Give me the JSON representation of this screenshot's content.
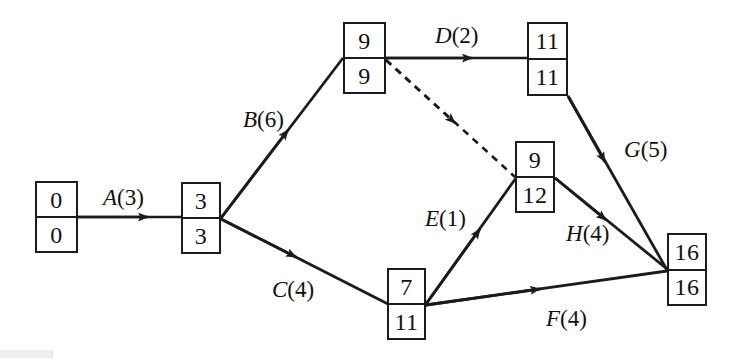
{
  "diagram": {
    "type": "pert-cpm-network",
    "canvas": {
      "width": 738,
      "height": 363
    },
    "line_color": "#1b1b1b",
    "text_color": "#111111",
    "background": "#ffffff",
    "nodes": [
      {
        "id": "n1",
        "early": "0",
        "late": "0",
        "x": 35,
        "y": 181,
        "w": 43,
        "h": 72
      },
      {
        "id": "n2",
        "early": "3",
        "late": "3",
        "x": 181,
        "y": 182,
        "w": 40,
        "h": 72
      },
      {
        "id": "n3",
        "early": "9",
        "late": "9",
        "x": 343,
        "y": 22,
        "w": 43,
        "h": 72
      },
      {
        "id": "n4",
        "early": "11",
        "late": "11",
        "x": 527,
        "y": 22,
        "w": 41,
        "h": 74
      },
      {
        "id": "n5",
        "early": "9",
        "late": "12",
        "x": 515,
        "y": 141,
        "w": 40,
        "h": 72
      },
      {
        "id": "n6",
        "early": "7",
        "late": "11",
        "x": 387,
        "y": 268,
        "w": 39,
        "h": 72
      },
      {
        "id": "n7",
        "early": "16",
        "late": "16",
        "x": 667,
        "y": 233,
        "w": 40,
        "h": 73
      }
    ],
    "edges": [
      {
        "id": "A",
        "activity": "A",
        "duration": "3",
        "label": "A(3)",
        "from": "n1",
        "to": "n2",
        "style": "solid",
        "label_x": 103,
        "label_y": 186
      },
      {
        "id": "B",
        "activity": "B",
        "duration": "6",
        "label": "B(6)",
        "from": "n2",
        "to": "n3",
        "style": "solid",
        "label_x": 243,
        "label_y": 108
      },
      {
        "id": "C",
        "activity": "C",
        "duration": "4",
        "label": "C(4)",
        "from": "n2",
        "to": "n6",
        "style": "solid",
        "label_x": 272,
        "label_y": 278
      },
      {
        "id": "D",
        "activity": "D",
        "duration": "2",
        "label": "D(2)",
        "from": "n3",
        "to": "n4",
        "style": "solid",
        "label_x": 435,
        "label_y": 24
      },
      {
        "id": "E",
        "activity": "E",
        "duration": "1",
        "label": "E(1)",
        "from": "n6",
        "to": "n5",
        "style": "solid",
        "label_x": 425,
        "label_y": 207
      },
      {
        "id": "F",
        "activity": "F",
        "duration": "4",
        "label": "F(4)",
        "from": "n6",
        "to": "n7",
        "style": "solid",
        "label_x": 546,
        "label_y": 307
      },
      {
        "id": "G",
        "activity": "G",
        "duration": "5",
        "label": "G(5)",
        "from": "n4",
        "to": "n7",
        "style": "solid",
        "label_x": 624,
        "label_y": 138
      },
      {
        "id": "H",
        "activity": "H",
        "duration": "4",
        "label": "H(4)",
        "from": "n5",
        "to": "n7",
        "style": "solid",
        "label_x": 566,
        "label_y": 222
      },
      {
        "id": "dummy",
        "activity": "",
        "duration": "",
        "label": "",
        "from": "n3",
        "to": "n5",
        "style": "dashed",
        "label_x": 0,
        "label_y": 0
      }
    ]
  }
}
